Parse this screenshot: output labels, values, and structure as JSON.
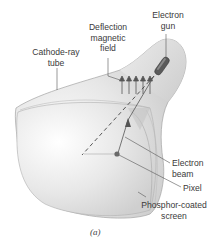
{
  "figure": {
    "caption": "(a)",
    "subject": "Cathode-ray tube",
    "labels": {
      "electron_gun": [
        "Electron",
        "gun"
      ],
      "deflection_field": [
        "Deflection",
        "magnetic",
        "field"
      ],
      "cathode_ray_tube": [
        "Cathode-ray",
        "tube"
      ],
      "electron_beam": [
        "Electron",
        "beam"
      ],
      "pixel": [
        "Pixel"
      ],
      "phosphor_screen": [
        "Phosphor-coated",
        "screen"
      ]
    },
    "colors": {
      "background": "#ffffff",
      "tube_fill": "#e2e2e2",
      "tube_outline": "#9a9a9a",
      "leader_line": "#555555",
      "gun": "#555555",
      "text": "#3a3a3a"
    }
  }
}
